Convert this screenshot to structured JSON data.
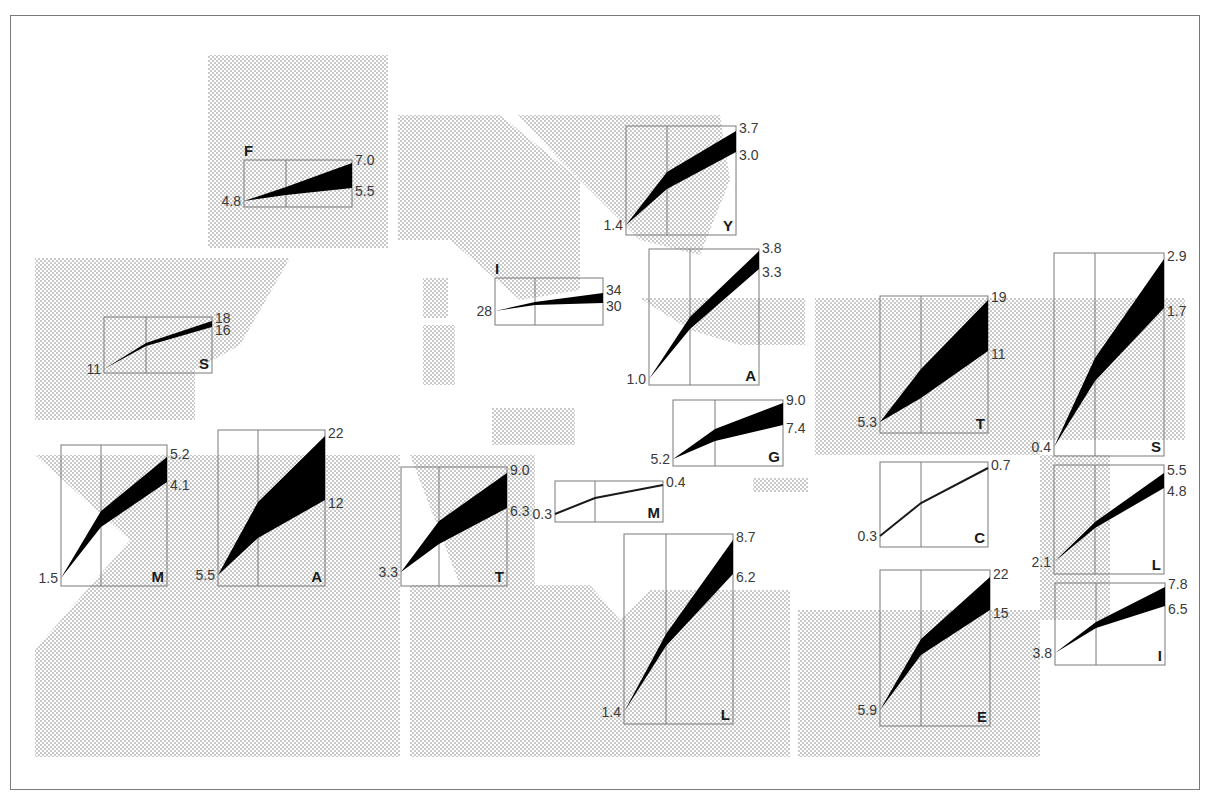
{
  "figure": {
    "type": "small-multiples band chart on map",
    "colors": {
      "band": "#000000",
      "panel_border": "#7a7a7a",
      "land_dots": "#b0b0b0",
      "frame": "#7a7a7a",
      "text": "#3a3a3a"
    }
  },
  "regions": [
    {
      "name": "region-scandinavia",
      "points": "208,55 388,55 388,248 208,248"
    },
    {
      "name": "region-iberia",
      "points": "35,258 290,258 240,345 195,370 195,420 35,420"
    },
    {
      "name": "region-central-europe",
      "points": "398,115 500,115 580,180 580,290 520,300 450,240 398,240"
    },
    {
      "name": "region-eastern-europe",
      "points": "518,115 720,115 730,180 700,255 640,240 560,160"
    },
    {
      "name": "region-balkans",
      "points": "640,298 805,298 805,345 740,345 690,330"
    },
    {
      "name": "region-anatolia",
      "points": "815,298 1185,298 1185,440 1040,440 1040,455 815,455"
    },
    {
      "name": "region-levant",
      "points": "1040,455 1110,455 1110,620 1040,620"
    },
    {
      "name": "region-north-africa-west",
      "points": "35,455 400,455 400,757 35,757 35,650 130,540"
    },
    {
      "name": "region-north-africa-central",
      "points": "410,455 535,455 535,585 410,585 410,620 460,585"
    },
    {
      "name": "region-sahara",
      "points": "410,585 590,585 620,620 650,590 790,590 790,757 410,757"
    },
    {
      "name": "region-egypt",
      "points": "798,610 1040,610 1040,757 798,757"
    },
    {
      "name": "region-island-1",
      "points": "423,278 448,278 448,318 423,318"
    },
    {
      "name": "region-island-2",
      "points": "423,325 455,325 455,385 423,385"
    },
    {
      "name": "region-island-3",
      "points": "492,408 575,408 575,445 492,445"
    },
    {
      "name": "region-island-4",
      "points": "753,478 808,478 808,492 753,492"
    },
    {
      "name": "region-island-5",
      "points": "358,232 370,232 370,245 358,245"
    }
  ],
  "panels": [
    {
      "id": "F",
      "label": "F",
      "x": 244,
      "y": 160,
      "w": 108,
      "h": 47,
      "start": "4.8",
      "high": "7.0",
      "low": "5.5",
      "p": [
        [
          0,
          41
        ],
        [
          42,
          27
        ],
        [
          108,
          3
        ]
      ],
      "q": [
        [
          0,
          41
        ],
        [
          42,
          35
        ],
        [
          108,
          28
        ]
      ],
      "label_pos": "top-left"
    },
    {
      "id": "S1",
      "label": "S",
      "x": 104,
      "y": 317,
      "w": 108,
      "h": 56,
      "start": "11",
      "high": "18",
      "low": "16",
      "p": [
        [
          0,
          52
        ],
        [
          42,
          26
        ],
        [
          108,
          4
        ]
      ],
      "q": [
        [
          0,
          52
        ],
        [
          42,
          29
        ],
        [
          108,
          10
        ]
      ],
      "label_pos": "bottom-right"
    },
    {
      "id": "I1",
      "label": "I",
      "x": 495,
      "y": 278,
      "w": 108,
      "h": 47,
      "start": "28",
      "high": "34",
      "low": "30",
      "p": [
        [
          0,
          33
        ],
        [
          40,
          24
        ],
        [
          108,
          15
        ]
      ],
      "q": [
        [
          0,
          33
        ],
        [
          40,
          27
        ],
        [
          108,
          25
        ]
      ],
      "label_pos": "top-left"
    },
    {
      "id": "Y",
      "label": "Y",
      "x": 626,
      "y": 126,
      "w": 110,
      "h": 109,
      "start": "1.4",
      "high": "3.7",
      "low": "3.0",
      "p": [
        [
          0,
          99
        ],
        [
          41,
          46
        ],
        [
          110,
          5
        ]
      ],
      "q": [
        [
          0,
          99
        ],
        [
          41,
          63
        ],
        [
          110,
          26
        ]
      ],
      "label_pos": "bottom-right"
    },
    {
      "id": "A1",
      "label": "A",
      "x": 649,
      "y": 249,
      "w": 110,
      "h": 136,
      "start": "1.0",
      "high": "3.8",
      "low": "3.3",
      "p": [
        [
          0,
          130
        ],
        [
          41,
          68
        ],
        [
          110,
          2
        ]
      ],
      "q": [
        [
          0,
          130
        ],
        [
          41,
          80
        ],
        [
          110,
          20
        ]
      ],
      "label_pos": "bottom-right"
    },
    {
      "id": "G",
      "label": "G",
      "x": 673,
      "y": 400,
      "w": 110,
      "h": 66,
      "start": "5.2",
      "high": "9.0",
      "low": "7.4",
      "p": [
        [
          0,
          59
        ],
        [
          42,
          29
        ],
        [
          110,
          3
        ]
      ],
      "q": [
        [
          0,
          59
        ],
        [
          42,
          41
        ],
        [
          110,
          25
        ]
      ],
      "label_pos": "bottom-right"
    },
    {
      "id": "M1",
      "label": "M",
      "x": 61,
      "y": 445,
      "w": 106,
      "h": 141,
      "start": "1.5",
      "high": "5.2",
      "low": "4.1",
      "p": [
        [
          0,
          133
        ],
        [
          40,
          66
        ],
        [
          106,
          12
        ]
      ],
      "q": [
        [
          0,
          133
        ],
        [
          40,
          82
        ],
        [
          106,
          37
        ]
      ],
      "label_pos": "bottom-right"
    },
    {
      "id": "A2",
      "label": "A",
      "x": 218,
      "y": 430,
      "w": 107,
      "h": 156,
      "start": "5.5",
      "high": "22",
      "low": "12",
      "p": [
        [
          0,
          145
        ],
        [
          40,
          72
        ],
        [
          107,
          6
        ]
      ],
      "q": [
        [
          0,
          145
        ],
        [
          40,
          108
        ],
        [
          107,
          70
        ]
      ],
      "label_pos": "bottom-right"
    },
    {
      "id": "T1",
      "label": "T",
      "x": 401,
      "y": 467,
      "w": 106,
      "h": 119,
      "start": "3.3",
      "high": "9.0",
      "low": "6.3",
      "p": [
        [
          0,
          105
        ],
        [
          38,
          54
        ],
        [
          106,
          6
        ]
      ],
      "q": [
        [
          0,
          105
        ],
        [
          38,
          77
        ],
        [
          106,
          41
        ]
      ],
      "label_pos": "bottom-right"
    },
    {
      "id": "M2",
      "label": "M",
      "x": 555,
      "y": 481,
      "w": 108,
      "h": 41,
      "start": "0.3",
      "high": "0.4",
      "low": "",
      "p": [
        [
          0,
          33
        ],
        [
          40,
          17
        ],
        [
          108,
          4
        ]
      ],
      "q": [
        [
          0,
          33
        ],
        [
          40,
          17
        ],
        [
          108,
          4
        ]
      ],
      "label_pos": "bottom-right",
      "line_only": true
    },
    {
      "id": "L1",
      "label": "L",
      "x": 624,
      "y": 534,
      "w": 109,
      "h": 190,
      "start": "1.4",
      "high": "8.7",
      "low": "6.2",
      "p": [
        [
          0,
          178
        ],
        [
          42,
          100
        ],
        [
          109,
          6
        ]
      ],
      "q": [
        [
          0,
          178
        ],
        [
          42,
          112
        ],
        [
          109,
          40
        ]
      ],
      "label_pos": "bottom-right"
    },
    {
      "id": "T2",
      "label": "T",
      "x": 880,
      "y": 296,
      "w": 108,
      "h": 137,
      "start": "5.3",
      "high": "19",
      "low": "11",
      "p": [
        [
          0,
          126
        ],
        [
          41,
          73
        ],
        [
          108,
          4
        ]
      ],
      "q": [
        [
          0,
          126
        ],
        [
          41,
          102
        ],
        [
          108,
          55
        ]
      ],
      "label_pos": "bottom-right"
    },
    {
      "id": "C",
      "label": "C",
      "x": 880,
      "y": 462,
      "w": 108,
      "h": 85,
      "start": "0.3",
      "high": "0.7",
      "low": "",
      "p": [
        [
          0,
          74
        ],
        [
          41,
          41
        ],
        [
          108,
          6
        ]
      ],
      "q": [
        [
          0,
          74
        ],
        [
          41,
          41
        ],
        [
          108,
          6
        ]
      ],
      "label_pos": "bottom-right",
      "line_only": true
    },
    {
      "id": "E",
      "label": "E",
      "x": 880,
      "y": 570,
      "w": 110,
      "h": 156,
      "start": "5.9",
      "high": "22",
      "low": "15",
      "p": [
        [
          0,
          140
        ],
        [
          41,
          69
        ],
        [
          110,
          7
        ]
      ],
      "q": [
        [
          0,
          140
        ],
        [
          41,
          85
        ],
        [
          110,
          40
        ]
      ],
      "label_pos": "bottom-right"
    },
    {
      "id": "S2",
      "label": "S",
      "x": 1054,
      "y": 253,
      "w": 110,
      "h": 203,
      "start": "0.4",
      "high": "2.9",
      "low": "1.7",
      "p": [
        [
          0,
          194
        ],
        [
          41,
          105
        ],
        [
          110,
          6
        ]
      ],
      "q": [
        [
          0,
          194
        ],
        [
          41,
          128
        ],
        [
          110,
          55
        ]
      ],
      "label_pos": "bottom-right"
    },
    {
      "id": "L2",
      "label": "L",
      "x": 1054,
      "y": 465,
      "w": 110,
      "h": 109,
      "start": "2.1",
      "high": "5.5",
      "low": "4.8",
      "p": [
        [
          0,
          97
        ],
        [
          41,
          57
        ],
        [
          110,
          8
        ]
      ],
      "q": [
        [
          0,
          97
        ],
        [
          41,
          63
        ],
        [
          110,
          23
        ]
      ],
      "label_pos": "bottom-right"
    },
    {
      "id": "I2",
      "label": "I",
      "x": 1055,
      "y": 583,
      "w": 110,
      "h": 82,
      "start": "3.8",
      "high": "7.8",
      "low": "6.5",
      "p": [
        [
          0,
          70
        ],
        [
          41,
          39
        ],
        [
          110,
          4
        ]
      ],
      "q": [
        [
          0,
          70
        ],
        [
          41,
          45
        ],
        [
          110,
          23
        ]
      ],
      "label_pos": "bottom-right"
    }
  ],
  "chart_data": {
    "type": "area",
    "title": "",
    "xlabel": "",
    "ylabel": "",
    "grid": "single vertical divider per panel",
    "series": [
      {
        "name": "F",
        "start": 4.8,
        "high": 7.0,
        "low": 5.5
      },
      {
        "name": "S (Spain)",
        "start": 11,
        "high": 18,
        "low": 16
      },
      {
        "name": "I (Italy)",
        "start": 28,
        "high": 34,
        "low": 30
      },
      {
        "name": "Y",
        "start": 1.4,
        "high": 3.7,
        "low": 3.0
      },
      {
        "name": "A (Albania)",
        "start": 1.0,
        "high": 3.8,
        "low": 3.3
      },
      {
        "name": "G",
        "start": 5.2,
        "high": 9.0,
        "low": 7.4
      },
      {
        "name": "M (Morocco)",
        "start": 1.5,
        "high": 5.2,
        "low": 4.1
      },
      {
        "name": "A (Algeria)",
        "start": 5.5,
        "high": 22,
        "low": 12
      },
      {
        "name": "T (Tunisia)",
        "start": 3.3,
        "high": 9.0,
        "low": 6.3
      },
      {
        "name": "M (Malta)",
        "start": 0.3,
        "end": 0.4
      },
      {
        "name": "L (Libya)",
        "start": 1.4,
        "high": 8.7,
        "low": 6.2
      },
      {
        "name": "T (Turkey)",
        "start": 5.3,
        "high": 19,
        "low": 11
      },
      {
        "name": "C",
        "start": 0.3,
        "end": 0.7
      },
      {
        "name": "E",
        "start": 5.9,
        "high": 22,
        "low": 15
      },
      {
        "name": "S (Syria)",
        "start": 0.4,
        "high": 2.9,
        "low": 1.7
      },
      {
        "name": "L (Lebanon)",
        "start": 2.1,
        "high": 5.5,
        "low": 4.8
      },
      {
        "name": "I (Israel)",
        "start": 3.8,
        "high": 7.8,
        "low": 6.5
      }
    ]
  }
}
